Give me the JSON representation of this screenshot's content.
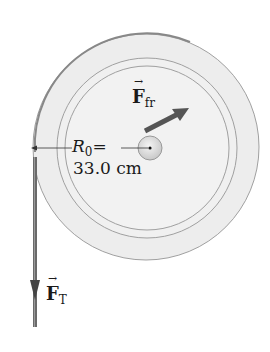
{
  "diagram": {
    "type": "physics-free-body",
    "labels": {
      "friction_force": {
        "symbol": "F",
        "subscript": "fr"
      },
      "tension_force": {
        "symbol": "F",
        "subscript": "T"
      },
      "radius": {
        "symbol": "R",
        "subscript": "0",
        "equals": "=",
        "value": "33.0 cm"
      }
    },
    "colors": {
      "disk_fill": "#eeeeee",
      "disk_stroke": "#9a9a9a",
      "arrow_fill": "#555555",
      "text": "#1a1a1a",
      "hub_fill": "#dcdcdc"
    }
  }
}
